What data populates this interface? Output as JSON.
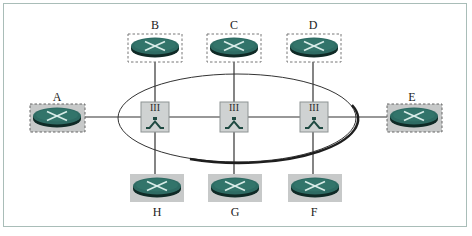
{
  "diagram": {
    "type": "network-topology",
    "colors": {
      "router_body": "#2e6b63",
      "router_shadow": "#0f2a26",
      "router_cross": "#d8ece8",
      "switch_box": "#cfd2d2",
      "switch_glyph": "#1f4a42",
      "gray_box": "#c7c9c9",
      "frame_border": "#a9bdb8",
      "line": "#333333"
    },
    "routers": [
      {
        "id": "A",
        "label": "A",
        "box": "dashed-gray"
      },
      {
        "id": "B",
        "label": "B",
        "box": "dashed-white"
      },
      {
        "id": "C",
        "label": "C",
        "box": "dashed-white"
      },
      {
        "id": "D",
        "label": "D",
        "box": "dashed-white"
      },
      {
        "id": "E",
        "label": "E",
        "box": "dashed-gray"
      },
      {
        "id": "F",
        "label": "F",
        "box": "solid-gray"
      },
      {
        "id": "G",
        "label": "G",
        "box": "solid-gray"
      },
      {
        "id": "H",
        "label": "H",
        "box": "solid-gray"
      }
    ],
    "switches": [
      {
        "id": "S1",
        "label": "III"
      },
      {
        "id": "S2",
        "label": "III"
      },
      {
        "id": "S3",
        "label": "III"
      }
    ],
    "links": [
      [
        "A",
        "S1"
      ],
      [
        "S1",
        "S2"
      ],
      [
        "S2",
        "S3"
      ],
      [
        "S3",
        "E"
      ],
      [
        "B",
        "S1"
      ],
      [
        "C",
        "S2"
      ],
      [
        "D",
        "S3"
      ],
      [
        "S1",
        "H"
      ],
      [
        "S2",
        "G"
      ],
      [
        "S3",
        "F"
      ]
    ],
    "grouping": "ellipse enclosing switches S1, S2, S3"
  }
}
